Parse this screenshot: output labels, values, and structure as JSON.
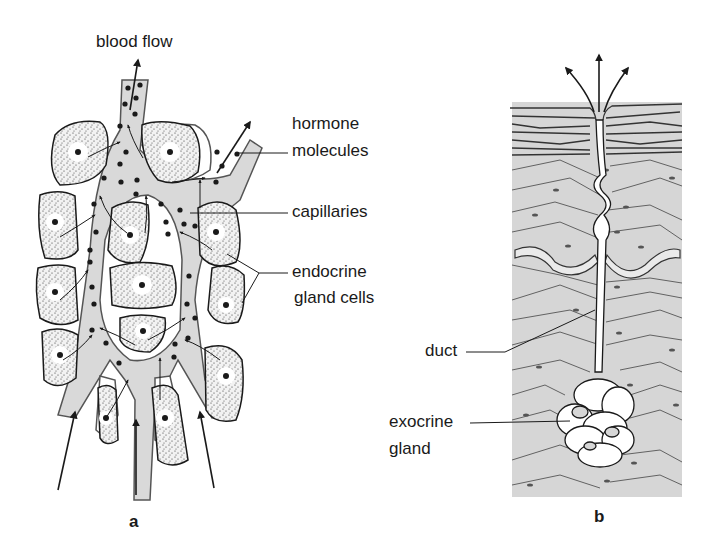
{
  "figure": {
    "panel_a": {
      "letter": "a",
      "labels": {
        "blood_flow": "blood flow",
        "hormone_molecules_1": "hormone",
        "hormone_molecules_2": "molecules",
        "capillaries": "capillaries",
        "endocrine_1": "endocrine",
        "endocrine_2": "gland cells"
      }
    },
    "panel_b": {
      "letter": "b",
      "labels": {
        "duct": "duct",
        "exocrine_1": "exocrine",
        "exocrine_2": "gland"
      }
    },
    "colors": {
      "line": "#1a1a1a",
      "capillary_fill": "#d9d9d9",
      "tissue_fill": "#d6d6d6",
      "cell_fill": "#efefef",
      "background": "#ffffff"
    }
  }
}
